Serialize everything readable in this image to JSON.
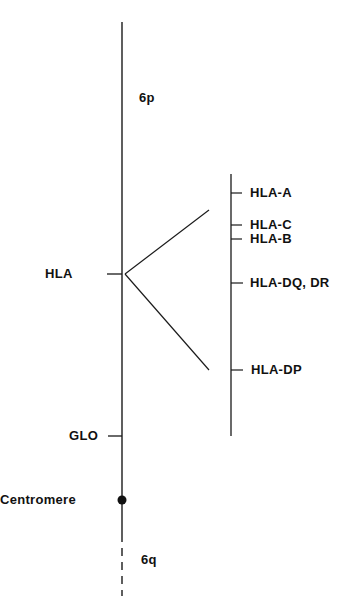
{
  "diagram": {
    "colors": {
      "line": "#1a1a1a",
      "text": "#111111",
      "background": "#ffffff"
    },
    "chromosome": {
      "arm_p_label": "6p",
      "arm_q_label": "6q",
      "centromere_label": "Centromere"
    },
    "loci": [
      {
        "id": "hla",
        "label": "HLA"
      },
      {
        "id": "glo",
        "label": "GLO"
      }
    ],
    "hla_region": {
      "genes": [
        {
          "id": "hla-a",
          "label": "HLA-A"
        },
        {
          "id": "hla-c",
          "label": "HLA-C"
        },
        {
          "id": "hla-b",
          "label": "HLA-B"
        },
        {
          "id": "hla-dq-dr",
          "label": "HLA-DQ, DR"
        },
        {
          "id": "hla-dp",
          "label": "HLA-DP"
        }
      ]
    }
  }
}
